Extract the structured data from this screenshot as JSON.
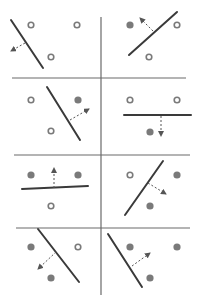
{
  "diagram": {
    "title": "",
    "width": 202,
    "height": 300,
    "colors": {
      "background": "#ffffff",
      "grid": "#6a6a6a",
      "line": "#3a3a3a",
      "arrow": "#555555",
      "filled_point": "#7a7a7a",
      "open_point_stroke": "#7a7a7a"
    },
    "grid": {
      "vertical": {
        "x": 101,
        "y1": 17,
        "y2": 295
      },
      "horizontal": [
        {
          "y": 78,
          "x1": 12,
          "x2": 186
        },
        {
          "y": 155,
          "x1": 14,
          "x2": 190
        },
        {
          "y": 228,
          "x1": 16,
          "x2": 190
        }
      ]
    },
    "panels": [
      {
        "id": 1,
        "points": [
          {
            "x": 31,
            "y": 25,
            "type": "open"
          },
          {
            "x": 77,
            "y": 25,
            "type": "open"
          },
          {
            "x": 51,
            "y": 57,
            "type": "open"
          }
        ],
        "line": {
          "x1": 11,
          "y1": 20,
          "x2": 43,
          "y2": 68
        },
        "arrow": {
          "x1": 25,
          "y1": 43,
          "x2": 11,
          "y2": 51
        }
      },
      {
        "id": 2,
        "points": [
          {
            "x": 130,
            "y": 25,
            "type": "filled"
          },
          {
            "x": 177,
            "y": 25,
            "type": "open"
          },
          {
            "x": 149,
            "y": 57,
            "type": "open"
          }
        ],
        "line": {
          "x1": 129,
          "y1": 55,
          "x2": 177,
          "y2": 12
        },
        "arrow": {
          "x1": 153,
          "y1": 31,
          "x2": 140,
          "y2": 18
        }
      },
      {
        "id": 3,
        "points": [
          {
            "x": 31,
            "y": 100,
            "type": "open"
          },
          {
            "x": 78,
            "y": 100,
            "type": "filled"
          },
          {
            "x": 51,
            "y": 131,
            "type": "open"
          }
        ],
        "line": {
          "x1": 47,
          "y1": 87,
          "x2": 80,
          "y2": 140
        },
        "arrow": {
          "x1": 70,
          "y1": 120,
          "x2": 89,
          "y2": 109
        }
      },
      {
        "id": 4,
        "points": [
          {
            "x": 130,
            "y": 100,
            "type": "open"
          },
          {
            "x": 177,
            "y": 100,
            "type": "open"
          },
          {
            "x": 150,
            "y": 132,
            "type": "filled"
          }
        ],
        "line": {
          "x1": 124,
          "y1": 115,
          "x2": 191,
          "y2": 115
        },
        "arrow": {
          "x1": 161,
          "y1": 116,
          "x2": 161,
          "y2": 136
        }
      },
      {
        "id": 5,
        "points": [
          {
            "x": 31,
            "y": 175,
            "type": "filled"
          },
          {
            "x": 78,
            "y": 175,
            "type": "filled"
          },
          {
            "x": 51,
            "y": 206,
            "type": "open"
          }
        ],
        "line": {
          "x1": 22,
          "y1": 189,
          "x2": 88,
          "y2": 186
        },
        "arrow": {
          "x1": 54,
          "y1": 188,
          "x2": 54,
          "y2": 168
        }
      },
      {
        "id": 6,
        "points": [
          {
            "x": 130,
            "y": 175,
            "type": "open"
          },
          {
            "x": 177,
            "y": 175,
            "type": "filled"
          },
          {
            "x": 150,
            "y": 206,
            "type": "filled"
          }
        ],
        "line": {
          "x1": 125,
          "y1": 215,
          "x2": 163,
          "y2": 161
        },
        "arrow": {
          "x1": 148,
          "y1": 183,
          "x2": 166,
          "y2": 194
        }
      },
      {
        "id": 7,
        "points": [
          {
            "x": 31,
            "y": 247,
            "type": "filled"
          },
          {
            "x": 78,
            "y": 247,
            "type": "open"
          },
          {
            "x": 51,
            "y": 278,
            "type": "filled"
          }
        ],
        "line": {
          "x1": 38,
          "y1": 229,
          "x2": 79,
          "y2": 282
        },
        "arrow": {
          "x1": 56,
          "y1": 252,
          "x2": 38,
          "y2": 269
        }
      },
      {
        "id": 8,
        "points": [
          {
            "x": 130,
            "y": 247,
            "type": "filled"
          },
          {
            "x": 177,
            "y": 247,
            "type": "filled"
          },
          {
            "x": 150,
            "y": 278,
            "type": "filled"
          }
        ],
        "line": {
          "x1": 108,
          "y1": 234,
          "x2": 142,
          "y2": 287
        },
        "arrow": {
          "x1": 132,
          "y1": 266,
          "x2": 150,
          "y2": 253
        }
      }
    ]
  }
}
